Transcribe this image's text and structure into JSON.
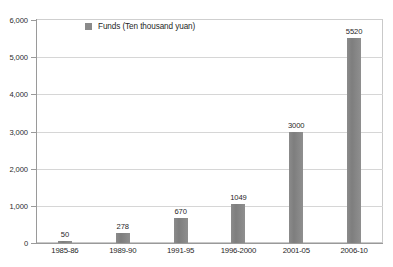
{
  "chart_data": {
    "type": "bar",
    "title": "China's Five-Year Plan to the Eleventh Five-Year Plan",
    "xlabel": "",
    "ylabel": "",
    "categories": [
      "1985-86",
      "1989-90",
      "1991-95",
      "1996-2000",
      "2001-05",
      "2006-10"
    ],
    "values": [
      50,
      278,
      670,
      1049,
      3000,
      5520
    ],
    "value_labels": [
      "50",
      "278",
      "670",
      "1049",
      "3000",
      "5520"
    ],
    "series": [
      {
        "name": "Funds (Ten thousand yuan)",
        "values": [
          50,
          278,
          670,
          1049,
          3000,
          5520
        ],
        "color": "#808080"
      }
    ],
    "ylim": [
      0,
      6000
    ],
    "yticks": [
      0,
      1000,
      2000,
      3000,
      4000,
      5000,
      6000
    ],
    "ytick_labels": [
      "0",
      "1,000",
      "2,000",
      "3,000",
      "4,000",
      "5,000",
      "6,000"
    ],
    "grid": true,
    "legend": {
      "position": "top-left-inside",
      "entries": [
        {
          "label": "Funds (Ten thousand yuan)",
          "color": "#808080",
          "swatch": "square-swatch"
        }
      ]
    },
    "colors": {
      "bar": "#808080",
      "gridline": "#d6d6d6",
      "axis": "#9a9a9a",
      "frame": "#c9c9c9",
      "text": "#1f1f1f",
      "background": "#ffffff"
    }
  }
}
